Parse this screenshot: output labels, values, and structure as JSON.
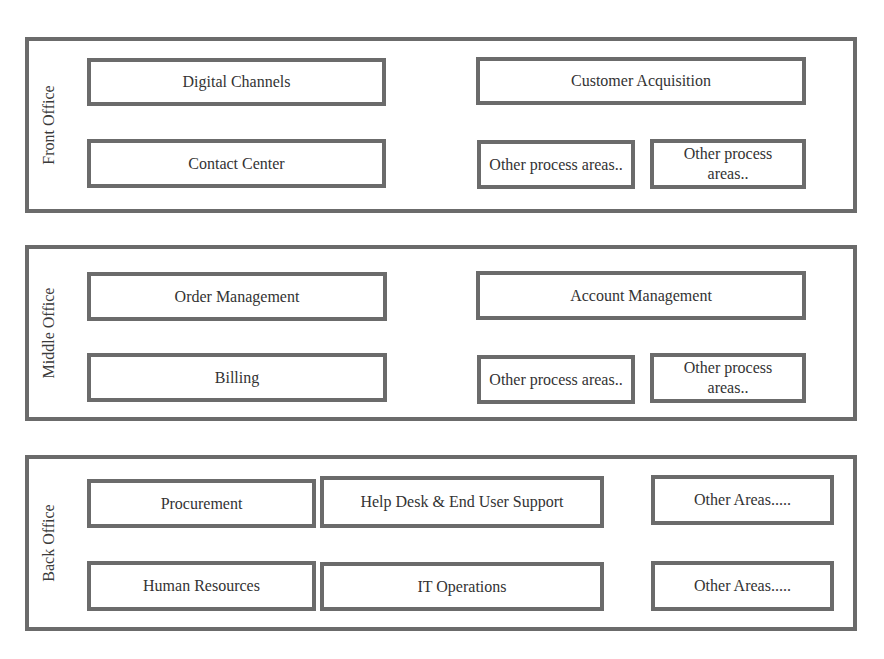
{
  "sections": [
    {
      "label": "Front Office",
      "boxes": [
        "Digital Channels",
        "Customer Acquisition",
        "Contact Center",
        "Other process areas..",
        "Other process areas.."
      ]
    },
    {
      "label": "Middle Office",
      "boxes": [
        "Order Management",
        "Account Management",
        "Billing",
        "Other process areas..",
        "Other process areas.."
      ]
    },
    {
      "label": "Back Office",
      "boxes": [
        "Procurement",
        "Help Desk & End User Support",
        "Other Areas.....",
        "Human Resources",
        "IT Operations",
        "Other Areas....."
      ]
    }
  ],
  "colors": {
    "border": "#6b6b6b",
    "text": "#333333",
    "background": "#ffffff"
  }
}
